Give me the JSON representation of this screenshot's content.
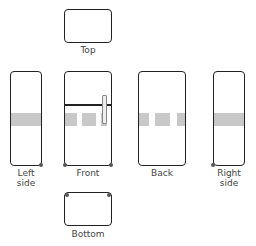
{
  "diagram": {
    "type": "orthographic-views",
    "views": [
      {
        "id": "top",
        "label": "Top"
      },
      {
        "id": "left",
        "label": "Left side",
        "label_lines": [
          "Left",
          "side"
        ]
      },
      {
        "id": "front",
        "label": "Front"
      },
      {
        "id": "back",
        "label": "Back"
      },
      {
        "id": "right",
        "label": "Right side",
        "label_lines": [
          "Right",
          "side"
        ]
      },
      {
        "id": "bottom",
        "label": "Bottom"
      }
    ],
    "colors": {
      "outline": "#222222",
      "band": "#c8c8c8",
      "label": "#444444"
    }
  }
}
